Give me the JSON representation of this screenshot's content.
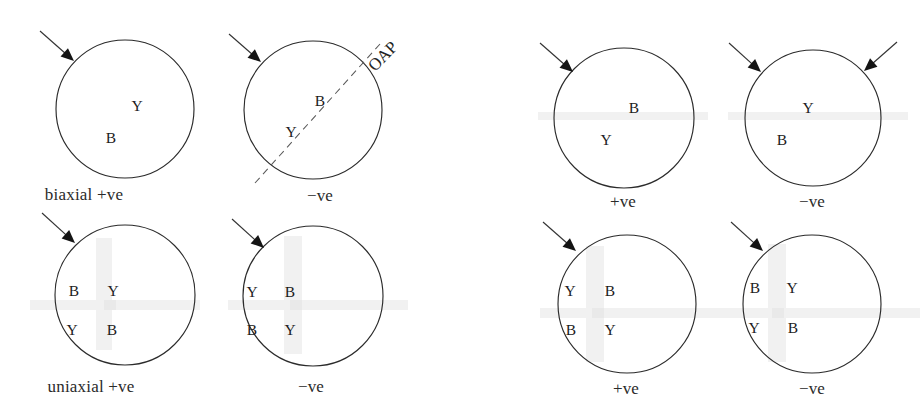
{
  "figure": {
    "background_color": "#ffffff",
    "stroke_color": "#2b2b2b",
    "groups": [
      {
        "name": "biaxial",
        "row_label": "biaxial",
        "diagrams": [
          {
            "sign_label": "biaxial +ve",
            "letters": [
              "Y",
              "B"
            ]
          },
          {
            "sign_label": "−ve",
            "letters": [
              "B",
              "Y"
            ],
            "annotation": "OAP"
          }
        ]
      },
      {
        "name": "biaxial-right",
        "diagrams": [
          {
            "sign_label": "+ve",
            "letters": [
              "B",
              "Y"
            ]
          },
          {
            "sign_label": "−ve",
            "letters": [
              "Y",
              "B"
            ]
          }
        ]
      },
      {
        "name": "uniaxial",
        "row_label": "uniaxial",
        "diagrams": [
          {
            "sign_label": "uniaxial +ve",
            "letters": [
              "B",
              "Y",
              "Y",
              "B"
            ]
          },
          {
            "sign_label": "−ve",
            "letters": [
              "Y",
              "B",
              "B",
              "Y"
            ]
          }
        ]
      },
      {
        "name": "uniaxial-right",
        "diagrams": [
          {
            "sign_label": "+ve",
            "letters": [
              "Y",
              "B",
              "B",
              "Y"
            ]
          },
          {
            "sign_label": "−ve",
            "letters": [
              "B",
              "Y",
              "Y",
              "B"
            ]
          }
        ]
      }
    ]
  },
  "circles": [
    {
      "id": "circle-1",
      "cx": 125,
      "cy": 109,
      "r": 69
    },
    {
      "id": "circle-2",
      "cx": 313,
      "cy": 110,
      "r": 69
    },
    {
      "id": "circle-3",
      "cx": 624,
      "cy": 118,
      "r": 70
    },
    {
      "id": "circle-4",
      "cx": 813,
      "cy": 118,
      "r": 68
    },
    {
      "id": "circle-5",
      "cx": 125,
      "cy": 295,
      "r": 70
    },
    {
      "id": "circle-6",
      "cx": 313,
      "cy": 296,
      "r": 70
    },
    {
      "id": "circle-7",
      "cx": 627,
      "cy": 304,
      "r": 69
    },
    {
      "id": "circle-8",
      "cx": 812,
      "cy": 304,
      "r": 69
    }
  ],
  "letters": [
    {
      "id": "letter-1a",
      "text": "Y",
      "x": 137,
      "y": 106
    },
    {
      "id": "letter-1b",
      "text": "B",
      "x": 111,
      "y": 138
    },
    {
      "id": "letter-2a",
      "text": "B",
      "x": 320,
      "y": 101
    },
    {
      "id": "letter-2b",
      "text": "Y",
      "x": 291,
      "y": 132
    },
    {
      "id": "letter-3a",
      "text": "B",
      "x": 634,
      "y": 108
    },
    {
      "id": "letter-3b",
      "text": "Y",
      "x": 606,
      "y": 140
    },
    {
      "id": "letter-4a",
      "text": "Y",
      "x": 808,
      "y": 108
    },
    {
      "id": "letter-4b",
      "text": "B",
      "x": 782,
      "y": 140
    },
    {
      "id": "letter-5a",
      "text": "B",
      "x": 74,
      "y": 291
    },
    {
      "id": "letter-5b",
      "text": "Y",
      "x": 113,
      "y": 291
    },
    {
      "id": "letter-5c",
      "text": "Y",
      "x": 72,
      "y": 330
    },
    {
      "id": "letter-5d",
      "text": "B",
      "x": 112,
      "y": 330
    },
    {
      "id": "letter-6a",
      "text": "Y",
      "x": 252,
      "y": 292
    },
    {
      "id": "letter-6b",
      "text": "B",
      "x": 290,
      "y": 292
    },
    {
      "id": "letter-6c",
      "text": "B",
      "x": 252,
      "y": 330
    },
    {
      "id": "letter-6d",
      "text": "Y",
      "x": 290,
      "y": 330
    },
    {
      "id": "letter-7a",
      "text": "Y",
      "x": 570,
      "y": 291
    },
    {
      "id": "letter-7b",
      "text": "B",
      "x": 610,
      "y": 291
    },
    {
      "id": "letter-7c",
      "text": "B",
      "x": 571,
      "y": 330
    },
    {
      "id": "letter-7d",
      "text": "Y",
      "x": 610,
      "y": 330
    },
    {
      "id": "letter-8a",
      "text": "B",
      "x": 755,
      "y": 288
    },
    {
      "id": "letter-8b",
      "text": "Y",
      "x": 792,
      "y": 288
    },
    {
      "id": "letter-8c",
      "text": "Y",
      "x": 754,
      "y": 328
    },
    {
      "id": "letter-8d",
      "text": "B",
      "x": 793,
      "y": 328
    }
  ],
  "captions": [
    {
      "id": "caption-biaxial-pos",
      "text": "biaxial +ve",
      "x": 84,
      "y": 194
    },
    {
      "id": "caption-biaxial-neg",
      "text": "−ve",
      "x": 320,
      "y": 195
    },
    {
      "id": "caption-biaxial-right-pos",
      "text": "+ve",
      "x": 623,
      "y": 201
    },
    {
      "id": "caption-biaxial-right-neg",
      "text": "−ve",
      "x": 812,
      "y": 201
    },
    {
      "id": "caption-uniaxial-pos",
      "text": "uniaxial +ve",
      "x": 91,
      "y": 386
    },
    {
      "id": "caption-uniaxial-neg",
      "text": "−ve",
      "x": 311,
      "y": 386
    },
    {
      "id": "caption-uniaxial-right-pos",
      "text": "+ve",
      "x": 626,
      "y": 388
    },
    {
      "id": "caption-uniaxial-right-neg",
      "text": "−ve",
      "x": 812,
      "y": 388
    }
  ],
  "annotations": {
    "oap": {
      "text": "OAP",
      "x": 371,
      "y": 60,
      "rotation": -46
    }
  },
  "arrows": [
    {
      "id": "arrow-1",
      "x1": 40,
      "y1": 31,
      "x2": 74,
      "y2": 61,
      "dir": "down-right"
    },
    {
      "id": "arrow-2",
      "x1": 229,
      "y1": 34,
      "x2": 261,
      "y2": 62,
      "dir": "down-right"
    },
    {
      "id": "arrow-3",
      "x1": 540,
      "y1": 43,
      "x2": 573,
      "y2": 72,
      "dir": "down-right"
    },
    {
      "id": "arrow-4",
      "x1": 729,
      "y1": 43,
      "x2": 761,
      "y2": 72,
      "dir": "down-right"
    },
    {
      "id": "arrow-5",
      "x1": 897,
      "y1": 42,
      "x2": 864,
      "y2": 71,
      "dir": "down-left"
    },
    {
      "id": "arrow-6",
      "x1": 42,
      "y1": 213,
      "x2": 75,
      "y2": 243,
      "dir": "down-right"
    },
    {
      "id": "arrow-7",
      "x1": 232,
      "y1": 219,
      "x2": 264,
      "y2": 248,
      "dir": "down-right"
    },
    {
      "id": "arrow-8",
      "x1": 543,
      "y1": 222,
      "x2": 576,
      "y2": 251,
      "dir": "down-right"
    },
    {
      "id": "arrow-9",
      "x1": 731,
      "y1": 222,
      "x2": 763,
      "y2": 251,
      "dir": "down-right"
    }
  ],
  "oap_line": {
    "x1": 255,
    "y1": 183,
    "x2": 380,
    "y2": 44
  }
}
